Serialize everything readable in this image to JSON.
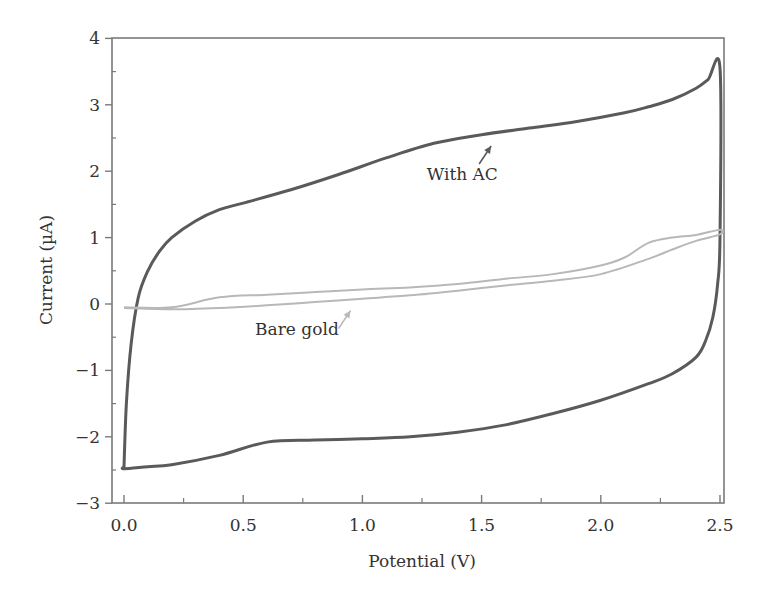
{
  "chart_data": {
    "type": "line",
    "title": "",
    "xlabel": "Potential (V)",
    "ylabel": "Current (µA)",
    "xlim": [
      -0.05,
      2.55
    ],
    "ylim": [
      -3,
      4
    ],
    "grid": false,
    "x_ticks": [
      0.0,
      0.5,
      1.0,
      1.5,
      2.0,
      2.5
    ],
    "x_tick_labels": [
      "0.0",
      "0.5",
      "1.0",
      "1.5",
      "2.0",
      "2.5"
    ],
    "y_ticks": [
      -3,
      -2,
      -1,
      0,
      1,
      2,
      3,
      4
    ],
    "y_tick_labels": [
      "−3",
      "−2",
      "−1",
      "0",
      "1",
      "2",
      "3",
      "4"
    ],
    "series": [
      {
        "name": "With AC",
        "color": "#5a5a5a",
        "x": [
          0.0,
          0.01,
          0.03,
          0.06,
          0.1,
          0.15,
          0.2,
          0.3,
          0.4,
          0.5,
          0.7,
          0.9,
          1.1,
          1.3,
          1.5,
          1.7,
          1.9,
          2.1,
          2.2,
          2.3,
          2.4,
          2.45,
          2.5,
          2.5,
          2.49,
          2.47,
          2.44,
          2.4,
          2.3,
          2.2,
          2.0,
          1.8,
          1.6,
          1.4,
          1.2,
          1.0,
          0.8,
          0.6,
          0.4,
          0.2,
          0.1,
          0.0,
          0.0
        ],
        "y": [
          -2.45,
          -1.5,
          -0.6,
          0.1,
          0.5,
          0.8,
          1.0,
          1.25,
          1.42,
          1.52,
          1.72,
          1.95,
          2.2,
          2.42,
          2.55,
          2.65,
          2.75,
          2.88,
          2.97,
          3.08,
          3.25,
          3.38,
          3.55,
          1.0,
          0.3,
          -0.2,
          -0.55,
          -0.8,
          -1.05,
          -1.2,
          -1.45,
          -1.65,
          -1.82,
          -1.93,
          -2.0,
          -2.03,
          -2.05,
          -2.08,
          -2.28,
          -2.42,
          -2.45,
          -2.48,
          -2.45
        ]
      },
      {
        "name": "Bare gold",
        "color": "#b8b8b8",
        "x": [
          0.0,
          0.2,
          0.4,
          0.6,
          0.8,
          1.0,
          1.2,
          1.4,
          1.6,
          1.8,
          2.0,
          2.1,
          2.2,
          2.3,
          2.4,
          2.5,
          2.5,
          2.4,
          2.3,
          2.2,
          2.0,
          1.8,
          1.6,
          1.4,
          1.2,
          1.0,
          0.8,
          0.6,
          0.4,
          0.2,
          0.0
        ],
        "y": [
          -0.05,
          -0.05,
          0.1,
          0.14,
          0.18,
          0.22,
          0.25,
          0.3,
          0.38,
          0.45,
          0.58,
          0.7,
          0.92,
          1.0,
          1.04,
          1.12,
          1.05,
          0.95,
          0.82,
          0.68,
          0.45,
          0.35,
          0.28,
          0.2,
          0.13,
          0.08,
          0.03,
          -0.02,
          -0.06,
          -0.08,
          -0.06
        ]
      }
    ],
    "annotations": [
      {
        "text": "With AC",
        "x": 1.27,
        "y": 1.87,
        "arrow_to": [
          1.54,
          2.38
        ]
      },
      {
        "text": "Bare gold",
        "x": 0.55,
        "y": -0.47,
        "arrow_to": [
          0.95,
          -0.1
        ]
      }
    ]
  }
}
